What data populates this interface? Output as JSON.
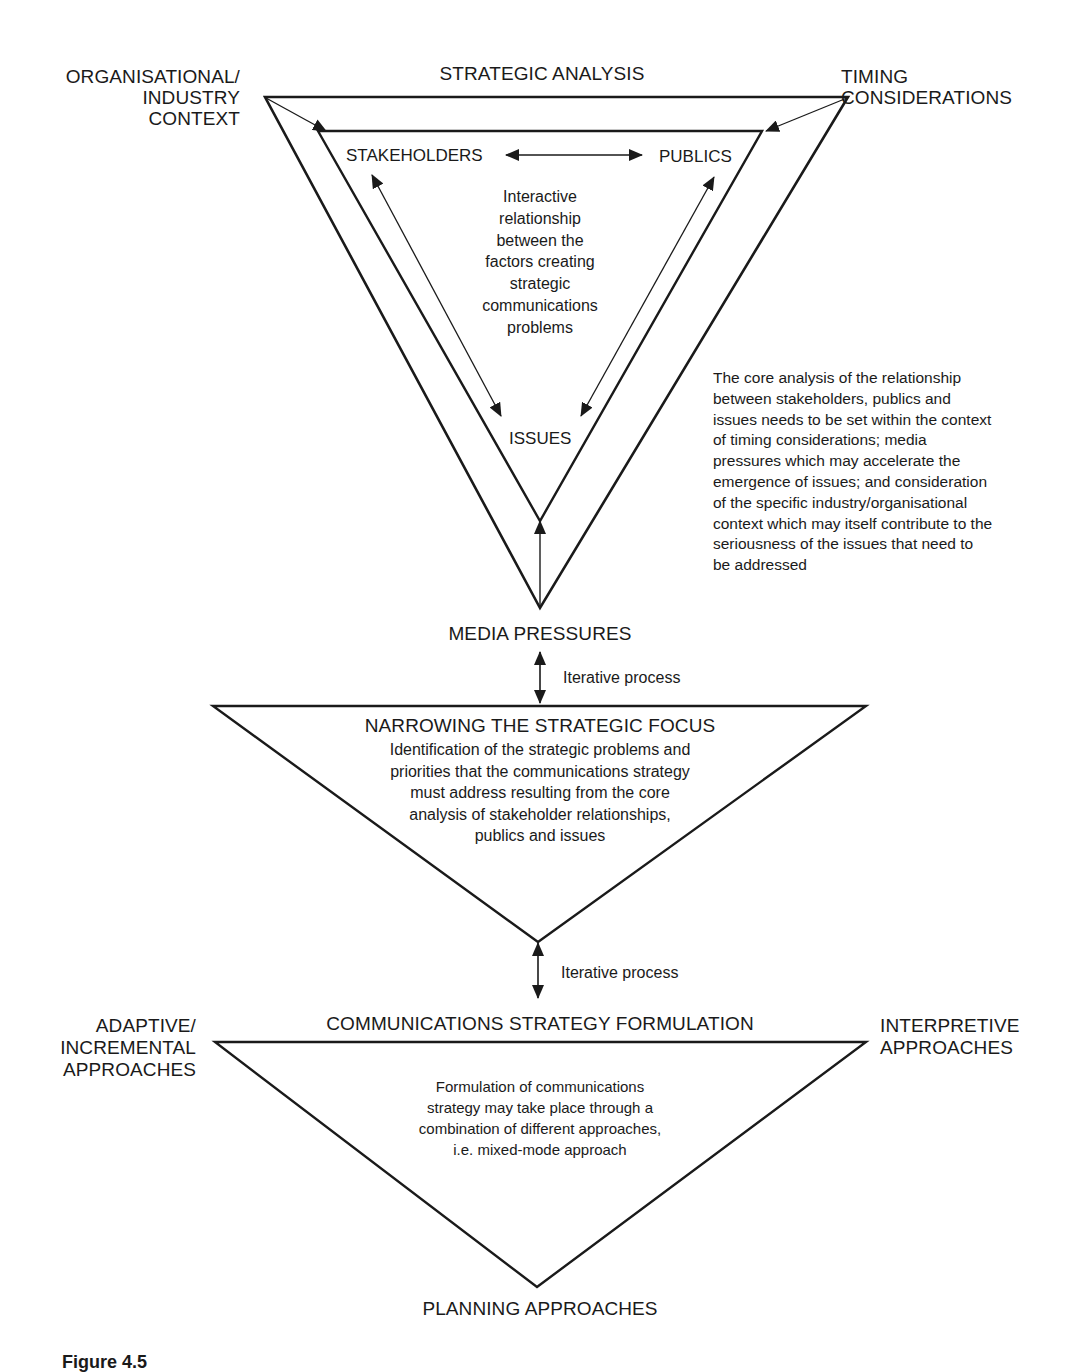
{
  "top_section": {
    "title": "STRATEGIC ANALYSIS",
    "corner_left": [
      "ORGANISATIONAL/",
      "INDUSTRY",
      "CONTEXT"
    ],
    "corner_right": [
      "TIMING",
      "CONSIDERATIONS"
    ],
    "inner": {
      "stakeholders": "STAKEHOLDERS",
      "publics": "PUBLICS",
      "issues": "ISSUES",
      "center_text": [
        "Interactive",
        "relationship",
        "between the",
        "factors creating",
        "strategic",
        "communications",
        "problems"
      ]
    },
    "bottom_label": "MEDIA PRESSURES",
    "side_note": [
      "The core analysis of the relationship",
      "between stakeholders, publics and",
      "issues needs to be set within the context",
      "of timing considerations; media",
      "pressures which may accelerate the",
      "emergence of issues; and consideration",
      "of the specific industry/organisational",
      "context which may itself contribute to the",
      "seriousness of the issues that need to",
      "be addressed"
    ]
  },
  "connector_1": {
    "label": "Iterative process"
  },
  "middle_section": {
    "title": "NARROWING THE STRATEGIC FOCUS",
    "body": [
      "Identification of the strategic problems and",
      "priorities that the communications strategy",
      "must address resulting from the core",
      "analysis of stakeholder relationships,",
      "publics and issues"
    ]
  },
  "connector_2": {
    "label": "Iterative process"
  },
  "bottom_section": {
    "title": "COMMUNICATIONS STRATEGY FORMULATION",
    "corner_left": [
      "ADAPTIVE/",
      "INCREMENTAL",
      "APPROACHES"
    ],
    "corner_right": [
      "INTERPRETIVE",
      "APPROACHES"
    ],
    "body": [
      "Formulation of communications",
      "strategy may take place through a",
      "combination of different approaches,",
      "i.e. mixed-mode approach"
    ],
    "bottom_label": "PLANNING APPROACHES"
  },
  "caption": {
    "text": "Figure 4.5"
  },
  "colors": {
    "ink": "#1a1a1a",
    "background": "#ffffff"
  }
}
